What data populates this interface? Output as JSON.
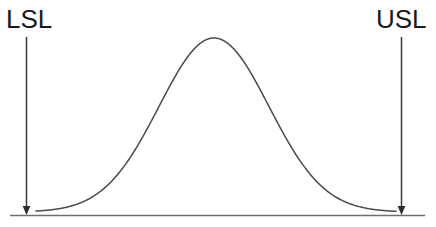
{
  "figure": {
    "title": "",
    "background_color": "#ffffff",
    "line_color": "#3a3a3a",
    "text_color": "#1a1a1a"
  },
  "labels": {
    "lower_spec_limit": "LSL",
    "upper_spec_limit": "USL"
  },
  "chart_data": {
    "type": "line",
    "title": "",
    "xlabel": "",
    "ylabel": "",
    "grid": false,
    "legend": "none",
    "annotations": [
      {
        "text": "LSL",
        "meaning": "Lower Specification Limit",
        "x_px": 26,
        "marker": "down-arrow",
        "arrow_from_y_px": 37,
        "arrow_to_y_px": 214
      },
      {
        "text": "USL",
        "meaning": "Upper Specification Limit",
        "x_px": 401,
        "marker": "down-arrow",
        "arrow_from_y_px": 37,
        "arrow_to_y_px": 214
      }
    ],
    "axis_line": {
      "x_start_px": 10,
      "x_end_px": 425,
      "y_px": 215
    },
    "series": [
      {
        "name": "normal-distribution",
        "distribution": "gaussian",
        "mean_px": 214,
        "sigma_px": 55,
        "peak_y_px": 38,
        "baseline_y_px": 212,
        "x_start_px": 36,
        "x_end_px": 396,
        "x": [
          36,
          56,
          76,
          96,
          116,
          136,
          156,
          176,
          196,
          214,
          232,
          252,
          272,
          292,
          312,
          332,
          352,
          372,
          396
        ],
        "y": [
          211.5,
          210.2,
          207.3,
          201.4,
          190.6,
          173.0,
          148.1,
          117.6,
          85.8,
          38.0,
          57.8,
          93.0,
          128.5,
          159.4,
          182.5,
          197.8,
          206.1,
          210.2,
          211.8
        ]
      }
    ],
    "xlim": [
      0,
      436
    ],
    "ylim": [
      227,
      0
    ]
  }
}
